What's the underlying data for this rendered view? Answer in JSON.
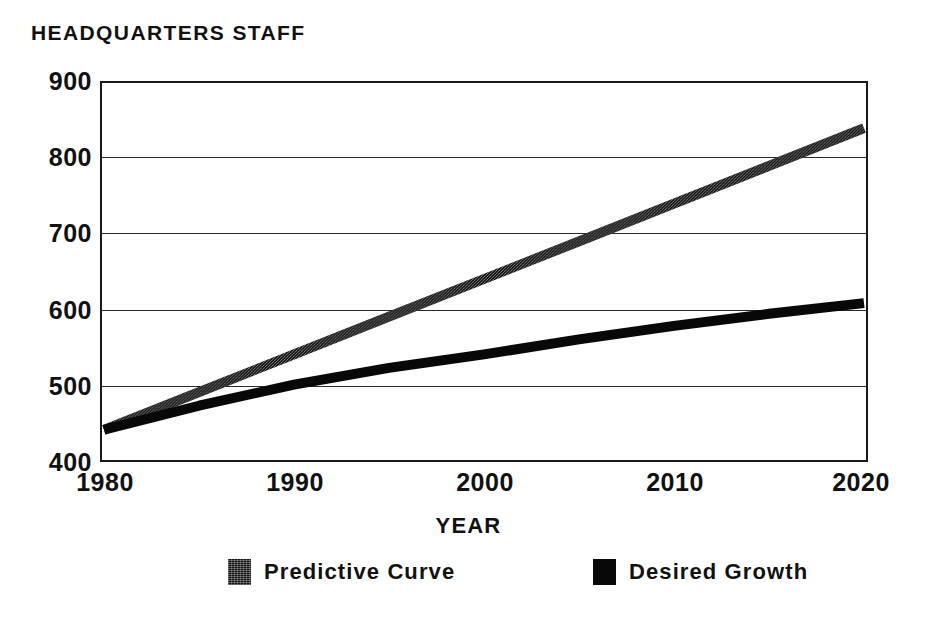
{
  "chart_data": {
    "type": "line",
    "title": "HEADQUARTERS STAFF",
    "xlabel": "YEAR",
    "ylabel": "",
    "xlim": [
      1980,
      2020
    ],
    "ylim": [
      400,
      900
    ],
    "grid": true,
    "legend_position": "bottom",
    "x_ticks": [
      "1980",
      "1990",
      "2000",
      "2010",
      "2020"
    ],
    "y_ticks": [
      "900",
      "800",
      "700",
      "600",
      "500",
      "400"
    ],
    "x": [
      1980,
      1985,
      1990,
      1995,
      2000,
      2005,
      2010,
      2015,
      2020
    ],
    "series": [
      {
        "name": "Predictive Curve",
        "style": "textured",
        "color": "#141414",
        "values": [
          440,
          490,
          540,
          590,
          640,
          690,
          740,
          790,
          840
        ]
      },
      {
        "name": "Desired Growth",
        "style": "solid",
        "color": "#080808",
        "values": [
          440,
          472,
          500,
          522,
          540,
          560,
          578,
          594,
          608
        ]
      }
    ]
  },
  "title": {
    "text": "HEADQUARTERS STAFF"
  },
  "axes": {
    "x_label": "YEAR",
    "y_ticks": [
      {
        "label": "900",
        "value": 900
      },
      {
        "label": "800",
        "value": 800
      },
      {
        "label": "700",
        "value": 700
      },
      {
        "label": "600",
        "value": 600
      },
      {
        "label": "500",
        "value": 500
      },
      {
        "label": "400",
        "value": 400
      }
    ],
    "x_ticks": [
      {
        "label": "1980",
        "value": 1980
      },
      {
        "label": "1990",
        "value": 1990
      },
      {
        "label": "2000",
        "value": 2000
      },
      {
        "label": "2010",
        "value": 2010
      },
      {
        "label": "2020",
        "value": 2020
      }
    ]
  },
  "legend": {
    "items": [
      {
        "label": "Predictive Curve",
        "swatch": "textured-dark-swatch"
      },
      {
        "label": "Desired Growth",
        "swatch": "solid-black-swatch"
      }
    ]
  }
}
